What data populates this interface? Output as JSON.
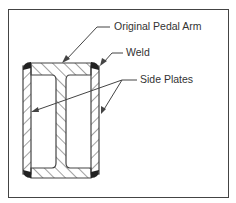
{
  "diagram": {
    "type": "cross-section",
    "labels": {
      "original_pedal_arm": "Original Pedal Arm",
      "weld": "Weld",
      "side_plates": "Side Plates"
    },
    "colors": {
      "line": "#444444",
      "weld": "#222222",
      "background": "#ffffff"
    }
  }
}
